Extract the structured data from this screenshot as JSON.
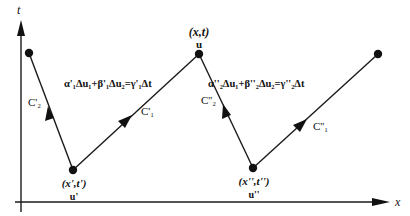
{
  "axes": {
    "x_label": "x",
    "t_label": "t"
  },
  "points": [
    {
      "id": "upper-left",
      "label": "",
      "sub": ""
    },
    {
      "id": "x-prime",
      "label": "(x',t')",
      "sub": "u'"
    },
    {
      "id": "x-t",
      "label": "(x,t)",
      "sub": "u"
    },
    {
      "id": "x-dprime",
      "label": "(x'',t'')",
      "sub": "u''"
    },
    {
      "id": "upper-right",
      "label": "",
      "sub": ""
    }
  ],
  "curves": {
    "c2_prime": "C'₂",
    "c1_prime": "C'₁",
    "c2_dprime": "C''₂",
    "c1_dprime": "C''₁"
  },
  "equations": {
    "eq1": "α'₁Δu₁+β'₁Δu₂=γ'₁Δt",
    "eq2": "α''₂Δu₁+β''₂Δu₂=γ''₂Δt"
  }
}
